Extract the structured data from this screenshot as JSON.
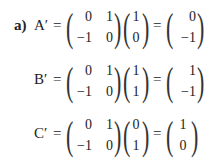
{
  "equations": [
    {
      "label": "a)",
      "lhs": "A′",
      "equals": "=",
      "matrix": [
        [
          "0",
          "1"
        ],
        [
          "−1",
          "0"
        ]
      ],
      "vector": [
        "1",
        "0"
      ],
      "result": [
        "0",
        "−1"
      ]
    },
    {
      "label": "",
      "lhs": "B′",
      "equals": "=",
      "matrix": [
        [
          "0",
          "1"
        ],
        [
          "−1",
          "0"
        ]
      ],
      "vector": [
        "1",
        "1"
      ],
      "result": [
        "1",
        "−1"
      ]
    },
    {
      "label": "",
      "lhs": "C′",
      "equals": "=",
      "matrix": [
        [
          "0",
          "1"
        ],
        [
          "−1",
          "0"
        ]
      ],
      "vector": [
        "0",
        "1"
      ],
      "result": [
        "1",
        "0"
      ]
    }
  ],
  "parens": {
    "open": "(",
    "close": ")"
  }
}
